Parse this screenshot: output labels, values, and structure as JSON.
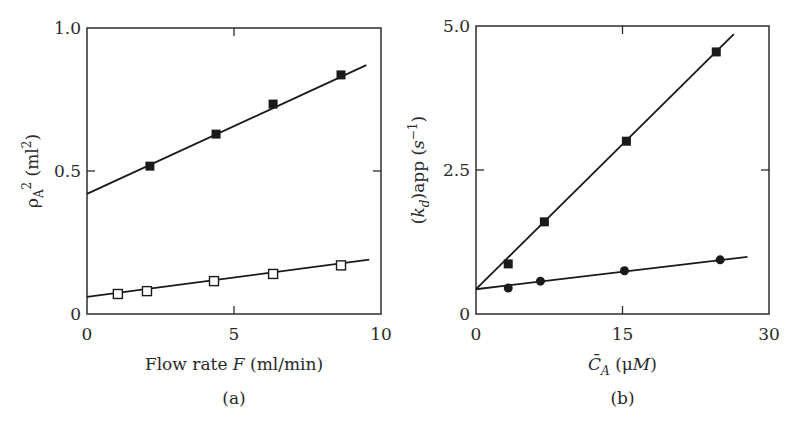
{
  "figure": {
    "panels": [
      {
        "id": "a",
        "caption": "(a)",
        "xlabel_parts": [
          {
            "text": "Flow rate ",
            "style": "normal"
          },
          {
            "text": "F",
            "style": "italic"
          },
          {
            "text": " (ml/min)",
            "style": "normal"
          }
        ],
        "ylabel_parts": [
          {
            "text": "ρ",
            "style": "normal"
          },
          {
            "text": "A",
            "style": "sub"
          },
          {
            "text": "2",
            "style": "sup"
          },
          {
            "text": " (ml",
            "style": "normal"
          },
          {
            "text": "2",
            "style": "sup"
          },
          {
            "text": ")",
            "style": "normal"
          }
        ],
        "xticks": [
          {
            "v": 0,
            "label": "0"
          },
          {
            "v": 5,
            "label": "5"
          },
          {
            "v": 10,
            "label": "10"
          }
        ],
        "yticks": [
          {
            "v": 0,
            "label": "0"
          },
          {
            "v": 0.5,
            "label": "0.5"
          },
          {
            "v": 1.0,
            "label": "1.0"
          }
        ]
      },
      {
        "id": "b",
        "caption": "(b)",
        "xlabel_parts": [
          {
            "text": "C̄",
            "style": "italic"
          },
          {
            "text": "A",
            "style": "italic-sub"
          },
          {
            "text": " (μ",
            "style": "normal"
          },
          {
            "text": "M",
            "style": "italic"
          },
          {
            "text": ")",
            "style": "normal"
          }
        ],
        "ylabel_parts": [
          {
            "text": "(",
            "style": "normal"
          },
          {
            "text": "k",
            "style": "italic"
          },
          {
            "text": "d",
            "style": "italic-sub"
          },
          {
            "text": ")app (",
            "style": "normal"
          },
          {
            "text": "s",
            "style": "italic"
          },
          {
            "text": "−1",
            "style": "sup"
          },
          {
            "text": ")",
            "style": "normal"
          }
        ],
        "xticks": [
          {
            "v": 0,
            "label": "0"
          },
          {
            "v": 15,
            "label": "15"
          },
          {
            "v": 30,
            "label": "30"
          }
        ],
        "yticks": [
          {
            "v": 0,
            "label": "0"
          },
          {
            "v": 2.5,
            "label": "2.5"
          },
          {
            "v": 5.0,
            "label": "5.0"
          }
        ]
      }
    ]
  },
  "chart_data": [
    {
      "type": "scatter",
      "panel": "a",
      "title": "",
      "xlabel": "Flow rate F (ml/min)",
      "ylabel": "ρA² (ml²)",
      "xlim": [
        0,
        10
      ],
      "ylim": [
        0,
        1.0
      ],
      "grid": false,
      "legend": "none",
      "series": [
        {
          "name": "filled squares",
          "marker": "square-filled",
          "x": [
            2.14,
            4.39,
            6.33,
            8.64
          ],
          "y": [
            0.517,
            0.629,
            0.734,
            0.836
          ],
          "fit_line": {
            "x": [
              0,
              9.5
            ],
            "y": [
              0.42,
              0.87
            ]
          }
        },
        {
          "name": "open squares",
          "marker": "square-open",
          "x": [
            1.05,
            2.04,
            4.32,
            6.33,
            8.64
          ],
          "y": [
            0.07,
            0.08,
            0.115,
            0.14,
            0.17
          ],
          "fit_line": {
            "x": [
              0,
              9.6
            ],
            "y": [
              0.06,
              0.19
            ]
          }
        }
      ]
    },
    {
      "type": "scatter",
      "panel": "b",
      "title": "",
      "xlabel": "C̄A (μM)",
      "ylabel": "(kd)app (s⁻¹)",
      "xlim": [
        0,
        30
      ],
      "ylim": [
        0,
        5.0
      ],
      "grid": false,
      "legend": "none",
      "series": [
        {
          "name": "filled squares",
          "marker": "square-filled",
          "x": [
            3.3,
            7.0,
            15.4,
            24.6
          ],
          "y": [
            0.87,
            1.6,
            3.0,
            4.55
          ],
          "fit_line": {
            "x": [
              0,
              26.4
            ],
            "y": [
              0.43,
              4.86
            ]
          }
        },
        {
          "name": "filled circles",
          "marker": "circle-filled",
          "x": [
            3.3,
            6.6,
            15.2,
            25.0
          ],
          "y": [
            0.45,
            0.57,
            0.75,
            0.94
          ],
          "fit_line": {
            "x": [
              0,
              27.8
            ],
            "y": [
              0.43,
              0.99
            ]
          }
        }
      ]
    }
  ]
}
